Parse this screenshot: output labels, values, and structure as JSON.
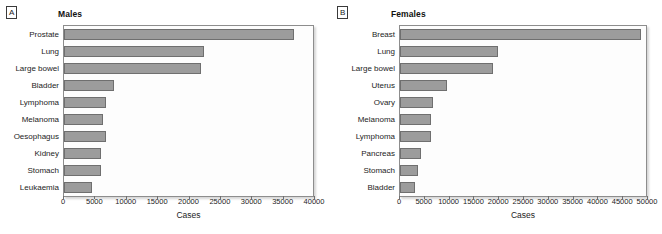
{
  "figure": {
    "background": "#ffffff",
    "bar_color": "#9c9c9c",
    "bar_border_color": "#6f6f6f"
  },
  "panels": [
    {
      "tag": "A",
      "title": "Males",
      "xlabel": "Cases",
      "ticks": [
        "0",
        "5000",
        "10000",
        "15000",
        "20000",
        "25000",
        "30000",
        "35000",
        "40000"
      ],
      "categories": [
        "Prostate",
        "Lung",
        "Large bowel",
        "Bladder",
        "Lymphoma",
        "Melanoma",
        "Oesophagus",
        "Kidney",
        "Stomach",
        "Leukaemia"
      ],
      "values": [
        37000,
        22500,
        22000,
        8000,
        6700,
        6300,
        6700,
        6000,
        6000,
        4500
      ]
    },
    {
      "tag": "B",
      "title": "Females",
      "xlabel": "Cases",
      "ticks": [
        "0",
        "5000",
        "10000",
        "15000",
        "20000",
        "25000",
        "30000",
        "35000",
        "40000",
        "45000",
        "50000"
      ],
      "categories": [
        "Breast",
        "Lung",
        "Large bowel",
        "Uterus",
        "Ovary",
        "Melanoma",
        "Lymphoma",
        "Pancreas",
        "Stomach",
        "Bladder"
      ],
      "values": [
        49000,
        20000,
        19000,
        9500,
        6800,
        6200,
        6200,
        4200,
        3600,
        3000
      ]
    }
  ],
  "chart_data": [
    {
      "type": "bar",
      "orientation": "horizontal",
      "title": "Males",
      "panel": "A",
      "xlabel": "Cases",
      "ylabel": "",
      "xlim": [
        0,
        40000
      ],
      "xticks": [
        0,
        5000,
        10000,
        15000,
        20000,
        25000,
        30000,
        35000,
        40000
      ],
      "grid": false,
      "legend": "none",
      "categories": [
        "Prostate",
        "Lung",
        "Large bowel",
        "Bladder",
        "Lymphoma",
        "Melanoma",
        "Oesophagus",
        "Kidney",
        "Stomach",
        "Leukaemia"
      ],
      "values": [
        37000,
        22500,
        22000,
        8000,
        6700,
        6300,
        6700,
        6000,
        6000,
        4500
      ]
    },
    {
      "type": "bar",
      "orientation": "horizontal",
      "title": "Females",
      "panel": "B",
      "xlabel": "Cases",
      "ylabel": "",
      "xlim": [
        0,
        50000
      ],
      "xticks": [
        0,
        5000,
        10000,
        15000,
        20000,
        25000,
        30000,
        35000,
        40000,
        45000,
        50000
      ],
      "grid": false,
      "legend": "none",
      "categories": [
        "Breast",
        "Lung",
        "Large bowel",
        "Uterus",
        "Ovary",
        "Melanoma",
        "Lymphoma",
        "Pancreas",
        "Stomach",
        "Bladder"
      ],
      "values": [
        49000,
        20000,
        19000,
        9500,
        6800,
        6200,
        6200,
        4200,
        3600,
        3000
      ]
    }
  ]
}
